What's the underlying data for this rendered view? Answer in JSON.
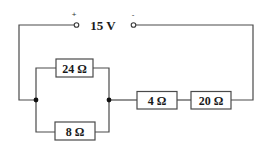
{
  "diagram": {
    "type": "circuit",
    "source": {
      "label": "15 V",
      "voltage": 15,
      "unit": "V",
      "positive_symbol": "+",
      "negative_symbol": "-"
    },
    "resistors": [
      {
        "id": "R1",
        "label": "24 Ω",
        "value": 24,
        "unit": "Ω",
        "connection": "parallel-top"
      },
      {
        "id": "R2",
        "label": "8 Ω",
        "value": 8,
        "unit": "Ω",
        "connection": "parallel-bottom"
      },
      {
        "id": "R3",
        "label": "4 Ω",
        "value": 4,
        "unit": "Ω",
        "connection": "series"
      },
      {
        "id": "R4",
        "label": "20 Ω",
        "value": 20,
        "unit": "Ω",
        "connection": "series"
      }
    ],
    "topology": "(24 Ω ∥ 8 Ω) in series with 4 Ω and 20 Ω across a 15 V source"
  }
}
